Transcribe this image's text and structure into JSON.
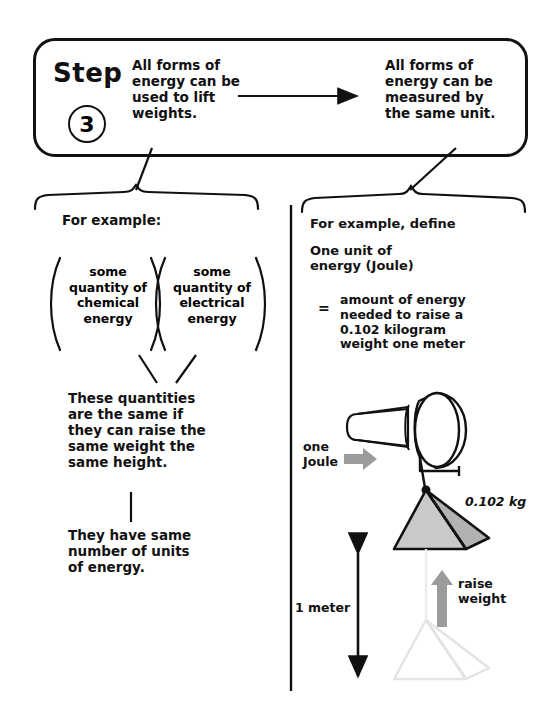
{
  "step": {
    "word": "Step",
    "number": "3",
    "statement_left": "All forms of\nenergy can be\nused to lift\nweights.",
    "arrow_icon": "right-arrow-icon",
    "statement_right": "All forms of\nenergy can be\nmeasured by\nthe same unit."
  },
  "left_column": {
    "for_example_label": "For example:",
    "group_chemical": "some\nquantity of\nchemical\nenergy",
    "group_electrical": "some\nquantity of\nelectrical\nenergy",
    "conclusion_1": "These quantities\nare the same if\nthey can raise the\nsame weight the\nsame height.",
    "conclusion_2": "They have same\nnumber of units\nof energy."
  },
  "right_column": {
    "for_example_label": "For example, define",
    "term": "One unit of\nenergy (Joule)",
    "equals_sign": "=",
    "definition": "amount of energy\nneeded to raise a\n0.102 kilogram\nweight one meter",
    "diagram": {
      "winch_label": "one\nJoule",
      "winch_arrow_icon": "right-arrow-gray-icon",
      "weight_label": "0.102 kg",
      "height_label": "1 meter",
      "height_arrow_icon": "double-headed-vertical-arrow-icon",
      "raise_label": "raise\nweight",
      "raise_arrow_icon": "up-arrow-gray-icon",
      "weight_shape": "pyramid",
      "ghost_weight_shape": "pyramid-outline-faint"
    }
  },
  "colors": {
    "ink": "#111111",
    "gray_arrow": "#9b9b9b",
    "pyramid_light": "#c9c9c9",
    "pyramid_dark": "#b2b2b2",
    "ghost": "#e3e3e3"
  }
}
